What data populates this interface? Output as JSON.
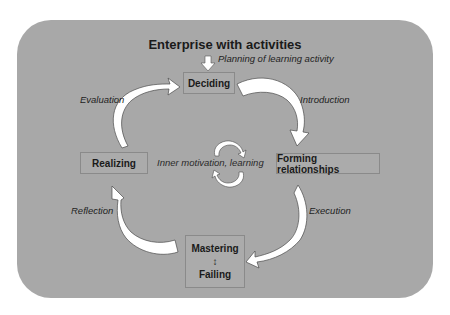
{
  "diagram": {
    "title": "Enterprise with activities",
    "entry_label": "Planning of learning activity",
    "center_label": "Inner motivation, learning",
    "nodes": {
      "deciding": "Deciding",
      "forming": "Forming relationships",
      "mastering": "Mastering",
      "mastering_symbol": "↕",
      "failing": "Failing",
      "realizing": "Realizing"
    },
    "edges": {
      "deciding_to_forming": "Introduction",
      "forming_to_mastering": "Execution",
      "mastering_to_realizing": "Reflection",
      "realizing_to_deciding": "Evaluation"
    },
    "colors": {
      "panel": "#a8a8a8",
      "arrow_fill": "#ffffff",
      "arrow_stroke": "#4a4a4a",
      "text": "#1a1a1a"
    }
  }
}
